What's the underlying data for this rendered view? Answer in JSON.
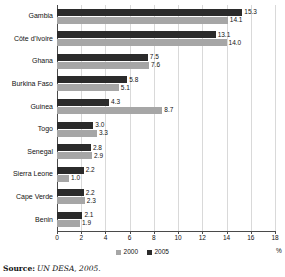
{
  "chart_data": {
    "type": "bar",
    "orientation": "horizontal",
    "title": "",
    "xlabel": "%",
    "ylabel": "",
    "xlim": [
      0,
      18
    ],
    "xticks": [
      0,
      2,
      4,
      6,
      8,
      10,
      12,
      14,
      16,
      18
    ],
    "grid": true,
    "legend_position": "bottom",
    "categories": [
      "Gambia",
      "Côte d'Ivoire",
      "Ghana",
      "Burkina Faso",
      "Guinea",
      "Togo",
      "Senegal",
      "Sierra Leone",
      "Cape Verde",
      "Benin"
    ],
    "series": [
      {
        "name": "2000",
        "color": "#a6a6a6",
        "values": [
          14.1,
          14.0,
          7.6,
          5.1,
          8.7,
          3.3,
          2.9,
          1.0,
          2.3,
          1.9
        ]
      },
      {
        "name": "2005",
        "color": "#2b2b2b",
        "values": [
          15.3,
          13.1,
          7.5,
          5.8,
          4.3,
          3.0,
          2.8,
          2.2,
          2.2,
          2.1
        ]
      }
    ],
    "value_label_format": "one-decimal"
  },
  "legend": {
    "items": [
      {
        "label": "2000",
        "color": "#a6a6a6"
      },
      {
        "label": "2005",
        "color": "#2b2b2b"
      }
    ]
  },
  "axis": {
    "unit": "%"
  },
  "source": {
    "prefix": "Source:",
    "text": "UN DESA, 2005."
  }
}
